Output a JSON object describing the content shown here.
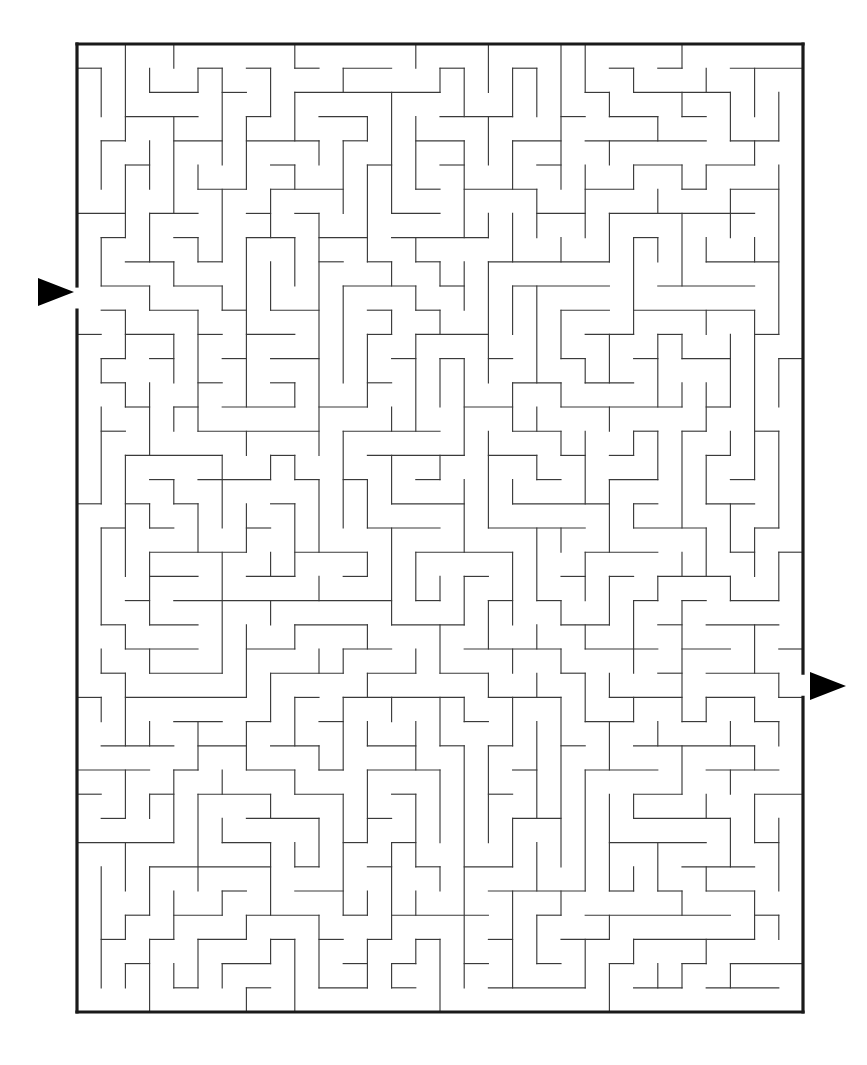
{
  "puzzle": {
    "kind": "maze",
    "title": "Rectangular Perfect Maze",
    "background_color": "#ffffff",
    "wall_color": "#3a3a3a",
    "border_color": "#1a1a1a",
    "marker_color": "#000000"
  },
  "geometry": {
    "canvas_width": 867,
    "canvas_height": 1065,
    "origin_x": 77,
    "origin_y": 44,
    "cell_size": 24.2,
    "columns": 30,
    "rows": 40,
    "maze_width": 726,
    "maze_height": 968,
    "wall_stroke_width": 1.15,
    "border_stroke_width": 3.2
  },
  "entrance": {
    "label": "entrance-arrow",
    "side": "left",
    "row": 10,
    "gap_x": 77,
    "gap_y_top": 286,
    "gap_y_bottom": 310,
    "arrow_tip_x": 74,
    "arrow_tail_x": 38,
    "arrow_center_y": 292,
    "arrow_half_height": 14,
    "direction": "right"
  },
  "exit": {
    "label": "exit-arrow",
    "side": "right",
    "row": 26,
    "gap_x": 803,
    "gap_y_top": 674,
    "gap_y_bottom": 698,
    "arrow_tip_x": 846,
    "arrow_tail_x": 810,
    "arrow_center_y": 686,
    "arrow_half_height": 14,
    "direction": "right"
  },
  "generation": {
    "algorithm": "depth-first-search-backtracker",
    "seed": 20240817,
    "braid": false,
    "description": "Perfect maze: exactly one path between any two cells."
  },
  "chart_data": {
    "type": "table",
    "columns": 30,
    "rows": 40,
    "cell_size_px": 24.2,
    "entrance_cell": [
      0,
      10
    ],
    "exit_cell": [
      29,
      26
    ],
    "wall_count_note": "Walls derived from spanning tree over 1200 cells"
  }
}
